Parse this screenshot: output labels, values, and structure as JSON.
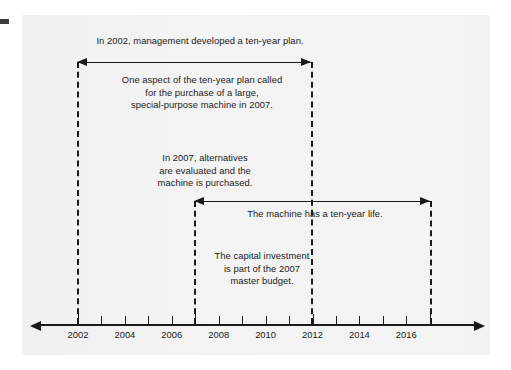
{
  "figure": {
    "type": "timeline-diagram",
    "background_color": "#f2f2f2",
    "line_color": "#1a1a1a",
    "text_color": "#1b1b1b"
  },
  "annotations": {
    "plan": "In 2002, management developed a ten-year plan.",
    "aspect": "One aspect of the ten-year plan called\nfor the purchase of a large,\nspecial-purpose machine in 2007.",
    "alternatives": "In 2007, alternatives\nare evaluated and the\nmachine is purchased.",
    "machine_life": "The machine has a ten-year life.",
    "capital_investment": "The capital investment\nis part of the 2007\nmaster budget."
  },
  "spans": [
    {
      "name": "ten-year-plan-span",
      "label": "In 2002, management developed a ten-year plan.",
      "start_year": 2002,
      "end_year": 2012,
      "duration_years": 10,
      "arrow": "double"
    },
    {
      "name": "machine-life-span",
      "label": "The machine has a ten-year life.",
      "start_year": 2007,
      "end_year": 2017,
      "duration_years": 10,
      "arrow": "double"
    }
  ],
  "markers": [
    {
      "name": "marker-2002",
      "year": 2002
    },
    {
      "name": "marker-2007",
      "year": 2007
    },
    {
      "name": "marker-2012",
      "year": 2012
    },
    {
      "name": "marker-2017",
      "year": 2017
    }
  ],
  "chart_data": {
    "type": "timeline",
    "title": "",
    "xlabel": "",
    "ylabel": "",
    "axis_range": [
      2001,
      2018
    ],
    "tick_years": [
      2002,
      2003,
      2004,
      2005,
      2006,
      2007,
      2008,
      2009,
      2010,
      2011,
      2012,
      2013,
      2014,
      2015,
      2016,
      2017
    ],
    "labeled_years": [
      2002,
      2004,
      2006,
      2008,
      2010,
      2012,
      2014,
      2016
    ],
    "tick_labels": [
      "2002",
      "2004",
      "2006",
      "2008",
      "2010",
      "2012",
      "2014",
      "2016"
    ],
    "grid": false,
    "legend": "none",
    "events": [
      {
        "year": 2002,
        "text": "In 2002, management developed a ten-year plan."
      },
      {
        "year": 2007,
        "text": "In 2007, alternatives are evaluated and the machine is purchased."
      },
      {
        "year": 2012,
        "text": "End of ten-year plan."
      },
      {
        "year": 2017,
        "text": "End of ten-year machine life."
      }
    ]
  }
}
